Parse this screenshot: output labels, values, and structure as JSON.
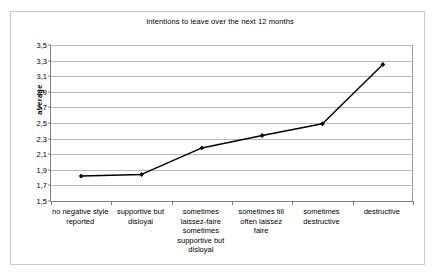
{
  "chart_data": {
    "type": "line",
    "title": "Intentions to leave over the next 12 months",
    "xlabel": "",
    "ylabel": "average",
    "ylim": [
      1.5,
      3.5
    ],
    "ytick_step": 0.2,
    "decimal_separator": ",",
    "grid": true,
    "legend": false,
    "marker": "filled-diamond",
    "line_color": "#000000",
    "marker_color": "#000000",
    "gridline_color": "#b8b8b8",
    "axis_color": "#808080",
    "categories": [
      "no negative style reported",
      "supportive but disloyal",
      "sometimes laissez-faire sometimes supportive but disloyal",
      "sometimes till often laissez faire",
      "sometimes destructive",
      "destructive"
    ],
    "category_lines": [
      [
        "no negative style",
        "reported"
      ],
      [
        "supportive but",
        "disloyal"
      ],
      [
        "sometimes",
        "laissez-faire",
        "sometimes",
        "supportive but",
        "disloyal"
      ],
      [
        "sometimes till",
        "often laissez",
        "faire"
      ],
      [
        "sometimes",
        "destructive"
      ],
      [
        "destructive"
      ]
    ],
    "values": [
      1.82,
      1.84,
      2.18,
      2.34,
      2.49,
      3.25
    ],
    "ytick_labels": [
      "3,5",
      "3,3",
      "3,1",
      "2,9",
      "2,7",
      "2,5",
      "2,3",
      "2,1",
      "1,9",
      "1,7",
      "1,5"
    ],
    "ytick_values": [
      3.5,
      3.3,
      3.1,
      2.9,
      2.7,
      2.5,
      2.3,
      2.1,
      1.9,
      1.7,
      1.5
    ],
    "series": [
      {
        "name": "average",
        "values": [
          1.82,
          1.84,
          2.18,
          2.34,
          2.49,
          3.25
        ]
      }
    ]
  }
}
